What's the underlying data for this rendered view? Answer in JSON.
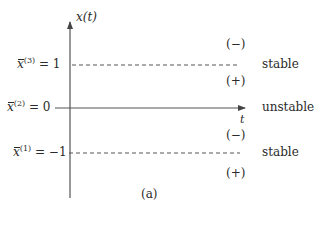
{
  "diagram": {
    "caption": "(a)",
    "axes": {
      "y_label": "x(t)",
      "x_label": "t"
    },
    "equilibria": [
      {
        "symbol": "x̄",
        "index": "(3)",
        "value_text": "= 1",
        "value": 1,
        "line_style": "dashed",
        "stability": "stable",
        "sign_above": "(−)",
        "sign_below": "(+)"
      },
      {
        "symbol": "x̄",
        "index": "(2)",
        "value_text": "= 0",
        "value": 0,
        "line_style": "solid",
        "stability": "unstable"
      },
      {
        "symbol": "x̄",
        "index": "(1)",
        "value_text": "= −1",
        "value": -1,
        "line_style": "dashed",
        "stability": "stable",
        "sign_above": "(−)",
        "sign_below": "(+)"
      }
    ],
    "colors": {
      "ink": "#2a2a2a",
      "axis": "#555555",
      "background": "#ffffff"
    }
  }
}
